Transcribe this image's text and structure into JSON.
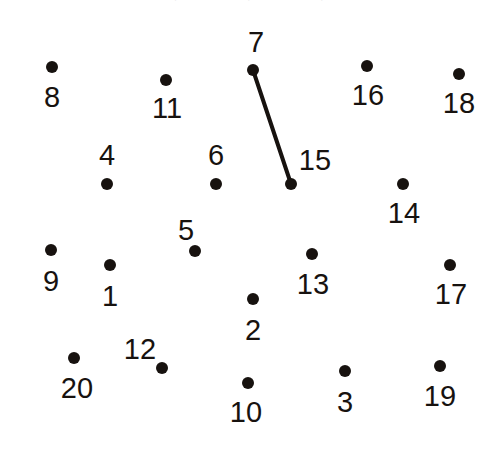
{
  "page": {
    "background_color": "#ffffff",
    "ink_color": "#17120f",
    "width": 498,
    "height": 450
  },
  "instruction": {
    "text": "Connect the dots 1 to 20 etc, 1 to 20 etc, 1 to 20 etc,",
    "color": "#9a9aa6",
    "note": "clipped at top edge of image"
  },
  "puzzle": {
    "dot_count": 20,
    "dot_radius": 6,
    "line_width": 4,
    "dots": [
      {
        "number": "1",
        "dot_x": 110,
        "dot_y": 265,
        "label_x": 110,
        "label_y": 296
      },
      {
        "number": "2",
        "dot_x": 253,
        "dot_y": 299,
        "label_x": 253,
        "label_y": 330
      },
      {
        "number": "3",
        "dot_x": 345,
        "dot_y": 371,
        "label_x": 345,
        "label_y": 402
      },
      {
        "number": "4",
        "dot_x": 107,
        "dot_y": 184,
        "label_x": 107,
        "label_y": 155
      },
      {
        "number": "5",
        "dot_x": 195,
        "dot_y": 251,
        "label_x": 186,
        "label_y": 230
      },
      {
        "number": "6",
        "dot_x": 216,
        "dot_y": 184,
        "label_x": 216,
        "label_y": 155
      },
      {
        "number": "7",
        "dot_x": 253,
        "dot_y": 70,
        "label_x": 256,
        "label_y": 42
      },
      {
        "number": "8",
        "dot_x": 52,
        "dot_y": 67,
        "label_x": 52,
        "label_y": 97
      },
      {
        "number": "9",
        "dot_x": 51,
        "dot_y": 250,
        "label_x": 51,
        "label_y": 281
      },
      {
        "number": "10",
        "dot_x": 248,
        "dot_y": 383,
        "label_x": 246,
        "label_y": 412
      },
      {
        "number": "11",
        "dot_x": 166,
        "dot_y": 80,
        "label_x": 167,
        "label_y": 108
      },
      {
        "number": "12",
        "dot_x": 162,
        "dot_y": 368,
        "label_x": 140,
        "label_y": 349
      },
      {
        "number": "13",
        "dot_x": 312,
        "dot_y": 254,
        "label_x": 313,
        "label_y": 284
      },
      {
        "number": "14",
        "dot_x": 403,
        "dot_y": 184,
        "label_x": 404,
        "label_y": 213
      },
      {
        "number": "15",
        "dot_x": 291,
        "dot_y": 184,
        "label_x": 315,
        "label_y": 160
      },
      {
        "number": "16",
        "dot_x": 367,
        "dot_y": 66,
        "label_x": 368,
        "label_y": 95
      },
      {
        "number": "17",
        "dot_x": 450,
        "dot_y": 265,
        "label_x": 451,
        "label_y": 294
      },
      {
        "number": "18",
        "dot_x": 459,
        "dot_y": 74,
        "label_x": 459,
        "label_y": 103
      },
      {
        "number": "19",
        "dot_x": 440,
        "dot_y": 366,
        "label_x": 440,
        "label_y": 396
      },
      {
        "number": "20",
        "dot_x": 74,
        "dot_y": 358,
        "label_x": 77,
        "label_y": 388
      }
    ],
    "segments": [
      {
        "from": "7",
        "to": "15",
        "x1": 253,
        "y1": 70,
        "x2": 291,
        "y2": 184
      }
    ]
  }
}
